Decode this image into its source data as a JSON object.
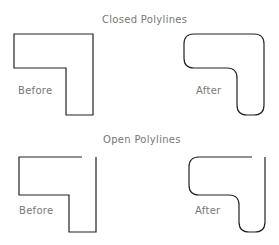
{
  "sections": [
    {
      "title": "Closed Polylines",
      "before_label": "Before",
      "after_label": "After"
    },
    {
      "title": "Open Polylines",
      "before_label": "Before",
      "after_label": "After"
    }
  ],
  "colors": {
    "line": "#222222",
    "text": "#777777",
    "background": "#ffffff"
  }
}
